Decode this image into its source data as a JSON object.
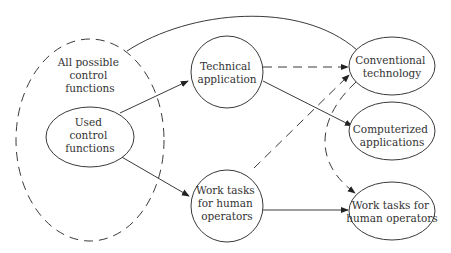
{
  "diagram": {
    "outer_set": {
      "label_lines": [
        "All possible",
        "control",
        "functions"
      ]
    },
    "nodes": {
      "used": {
        "label_lines": [
          "Used",
          "control",
          "functions"
        ]
      },
      "technical": {
        "label_lines": [
          "Technical",
          "application"
        ]
      },
      "worktasks_mid": {
        "label_lines": [
          "Work tasks",
          "for human",
          "operators"
        ]
      },
      "conventional": {
        "label_lines": [
          "Conventional",
          "technology"
        ]
      },
      "computerized": {
        "label_lines": [
          "Computerized",
          "applications"
        ]
      },
      "worktasks_right": {
        "label_lines": [
          "Work tasks for",
          "human operators"
        ]
      }
    },
    "edges": [
      {
        "from": "used",
        "to": "technical",
        "style": "solid"
      },
      {
        "from": "used",
        "to": "worktasks_mid",
        "style": "solid"
      },
      {
        "from": "technical",
        "to": "conventional",
        "style": "dashed"
      },
      {
        "from": "technical",
        "to": "computerized",
        "style": "solid"
      },
      {
        "from": "worktasks_mid",
        "to": "conventional",
        "style": "dashed"
      },
      {
        "from": "worktasks_mid",
        "to": "worktasks_right",
        "style": "solid"
      },
      {
        "from": "conventional",
        "to": "worktasks_right",
        "style": "dashed"
      },
      {
        "from": "outer_set",
        "to": "conventional",
        "style": "solid-curve"
      }
    ]
  }
}
